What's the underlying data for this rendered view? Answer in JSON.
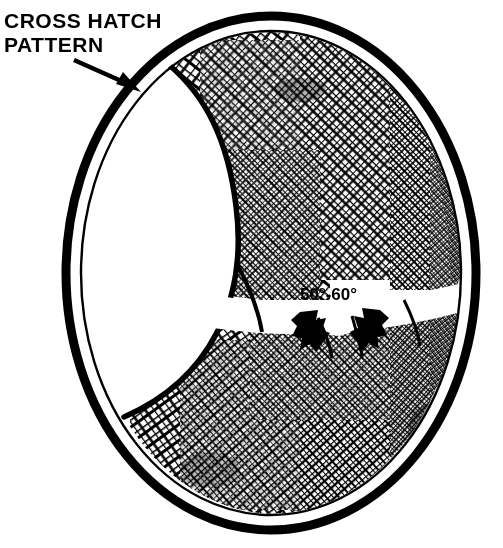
{
  "figure": {
    "kind": "technical-line-illustration",
    "background_color": "#ffffff",
    "ink_color": "#000000"
  },
  "callout": {
    "line1": "CROSS HATCH",
    "line2": "PATTERN",
    "arrow_name": "callout-arrow",
    "arrow_from": {
      "x": 74,
      "y": 60
    },
    "arrow_to": {
      "x": 140,
      "y": 92
    }
  },
  "angle_label": {
    "text": "50°-60°",
    "x": 330,
    "y": 297,
    "value_min_degrees": 50,
    "value_max_degrees": 60
  },
  "angle_arrows": [
    {
      "name": "angle-arrow-left",
      "x": 311,
      "y": 330,
      "direction": "down-right"
    },
    {
      "name": "angle-arrow-right",
      "x": 367,
      "y": 330,
      "direction": "down-left"
    }
  ],
  "bore": {
    "center_x": 271,
    "center_y": 273,
    "outer_rx": 209,
    "outer_ry": 261,
    "rim_thickness": 9,
    "gap_thickness": 11,
    "inner_rx": 189,
    "inner_ry": 241
  },
  "highlights": {
    "near_wall_crescent": "white unhatched crescent along the left inner wall",
    "equator_glare_band": "white horizontal glare band across the bore mid-height"
  },
  "hatch": {
    "angle_a_degrees": 52,
    "angle_b_degrees": -52,
    "description": "two opposing families of honing grooves forming a diamond crosshatch"
  }
}
